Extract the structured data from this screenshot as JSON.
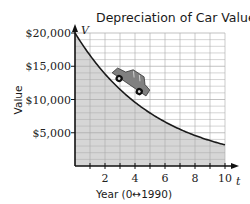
{
  "chart_data": {
    "type": "area",
    "title": "Depreciation of Car Value",
    "xlabel": "Year (0↔1990)",
    "ylabel": "Value",
    "x_variable": "t",
    "y_variable": "V",
    "xlim": [
      0,
      10
    ],
    "ylim": [
      0,
      20000
    ],
    "x_ticks": [
      2,
      4,
      6,
      8,
      10
    ],
    "x_tick_labels": [
      "2",
      "4",
      "6",
      "8",
      "10"
    ],
    "y_ticks": [
      5000,
      10000,
      15000,
      20000
    ],
    "y_tick_labels": [
      "$5,000",
      "$10,000",
      "$15,000",
      "$20,000"
    ],
    "grid": true,
    "legend": null,
    "series": [
      {
        "name": "Car value",
        "x": [
          0,
          1,
          2,
          3,
          4,
          5,
          6,
          7,
          8,
          9,
          10
        ],
        "values": [
          20000,
          16640,
          13840,
          11520,
          9580,
          7970,
          6630,
          5520,
          4590,
          3820,
          3180
        ]
      }
    ],
    "annotations": [
      "car illustration on curve near t=3 to 5"
    ]
  },
  "colors": {
    "fill": "#d6d6d6",
    "grid": "#a8a8a8",
    "curve": "#1a1a1a",
    "car_body": "#7a7a7a"
  }
}
